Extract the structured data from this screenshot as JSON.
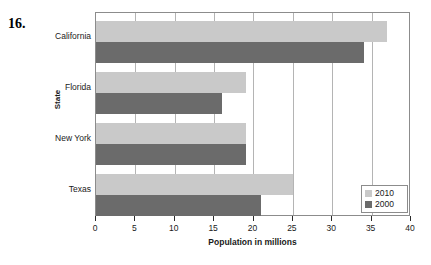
{
  "figure": {
    "problem_number": "16."
  },
  "chart_data": {
    "type": "bar",
    "orientation": "horizontal",
    "title": "",
    "xlabel": "Population in millions",
    "ylabel": "State",
    "categories": [
      "California",
      "Florida",
      "New York",
      "Texas"
    ],
    "series": [
      {
        "name": "2010",
        "color": "#c9c9c9",
        "values": [
          37,
          19,
          19,
          25
        ]
      },
      {
        "name": "2000",
        "color": "#6b6b6b",
        "values": [
          34,
          16,
          19,
          21
        ]
      }
    ],
    "xlim": [
      0,
      40
    ],
    "xticks": [
      0,
      5,
      10,
      15,
      20,
      25,
      30,
      35,
      40
    ],
    "xticklabels": [
      "0",
      "5",
      "10",
      "15",
      "20",
      "25",
      "30",
      "35",
      "40"
    ],
    "grid": "vertical",
    "legend_position": "bottom-right",
    "legend_entries": [
      "2010",
      "2000"
    ]
  }
}
